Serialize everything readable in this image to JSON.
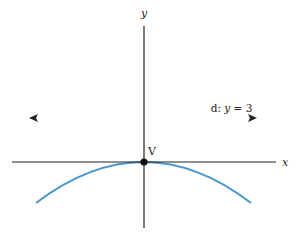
{
  "figure": {
    "type": "parabola-diagram",
    "axes": {
      "x_label": "x",
      "y_label": "y",
      "color": "#222222"
    },
    "directrix": {
      "label_prefix": "d: ",
      "label_var": "y",
      "label_eq": " = 3",
      "equation": "y = 3",
      "color_left": "#3dbb3d",
      "color_right": "#3a3a2a"
    },
    "vertex": {
      "label": "V",
      "color": "#111111"
    },
    "parabola": {
      "color": "#4a98cc",
      "opens": "down"
    }
  }
}
